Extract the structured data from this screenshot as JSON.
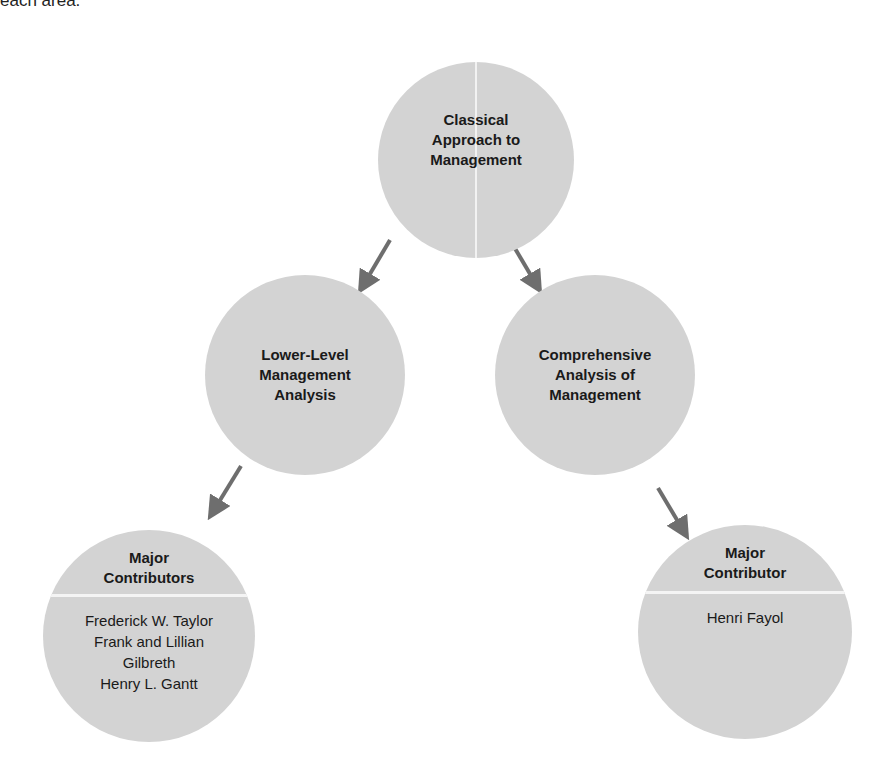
{
  "caption": "each area.",
  "diagram": {
    "root": {
      "label_lines": [
        "Classical",
        "Approach to",
        "Management"
      ]
    },
    "branches": [
      {
        "label_lines": [
          "Lower-Level",
          "Management",
          "Analysis"
        ],
        "contributors_box": {
          "heading_lines": [
            "Major",
            "Contributors"
          ],
          "names": [
            "Frederick W. Taylor",
            "Frank and Lillian",
            "Gilbreth",
            "Henry L. Gantt"
          ]
        }
      },
      {
        "label_lines": [
          "Comprehensive",
          "Analysis of",
          "Management"
        ],
        "contributors_box": {
          "heading_lines": [
            "Major",
            "Contributor"
          ],
          "names": [
            "Henri Fayol"
          ]
        }
      }
    ],
    "colors": {
      "circle_fill": "#d3d3d3",
      "arrow": "#6e6e6e",
      "divider": "#f4f4f4"
    }
  }
}
